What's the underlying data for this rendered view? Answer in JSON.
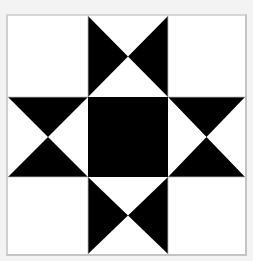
{
  "block": {
    "name": "Ohio Star quilt block",
    "grid": "3x3",
    "colors": {
      "background": "#f3f3f3",
      "frame_border": "#c8c8c8",
      "light": "#ffffff",
      "dark": "#000000"
    },
    "cells": [
      {
        "row": 0,
        "col": 0,
        "pattern": "plain-light"
      },
      {
        "row": 0,
        "col": 1,
        "pattern": "hourglass-dark-left-right"
      },
      {
        "row": 0,
        "col": 2,
        "pattern": "plain-light"
      },
      {
        "row": 1,
        "col": 0,
        "pattern": "hourglass-dark-top-bottom"
      },
      {
        "row": 1,
        "col": 1,
        "pattern": "plain-dark"
      },
      {
        "row": 1,
        "col": 2,
        "pattern": "hourglass-dark-top-bottom"
      },
      {
        "row": 2,
        "col": 0,
        "pattern": "plain-light"
      },
      {
        "row": 2,
        "col": 1,
        "pattern": "hourglass-dark-left-right"
      },
      {
        "row": 2,
        "col": 2,
        "pattern": "plain-light"
      }
    ]
  }
}
